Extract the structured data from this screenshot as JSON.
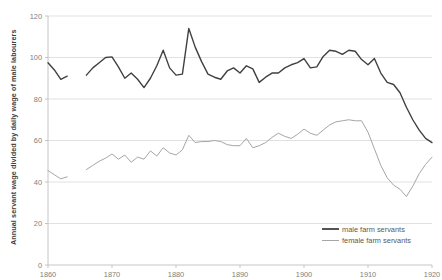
{
  "chart_data": {
    "type": "line",
    "title": "",
    "xlabel": "",
    "ylabel": "Annual servant wage divided by daily wage of male labourers",
    "xlim": [
      1860,
      1920
    ],
    "ylim": [
      0,
      120
    ],
    "xticks": [
      1860,
      1870,
      1880,
      1890,
      1900,
      1910,
      1920
    ],
    "yticks": [
      0,
      20,
      40,
      60,
      80,
      100,
      120
    ],
    "grid": true,
    "legend_position": "bottom-right",
    "series": [
      {
        "name": "male farm servants",
        "color": "#404040",
        "width": 1.4,
        "segments": [
          {
            "x": [
              1860,
              1861,
              1862,
              1863
            ],
            "y": [
              97.5,
              94.0,
              89.5,
              91.0
            ]
          },
          {
            "x": [
              1866,
              1867,
              1868,
              1869,
              1870,
              1871,
              1872,
              1873,
              1874,
              1875,
              1876,
              1877,
              1878,
              1879,
              1880,
              1881,
              1882,
              1883,
              1884,
              1885,
              1886,
              1887,
              1888,
              1889,
              1890,
              1891,
              1892,
              1893,
              1894,
              1895,
              1896,
              1897,
              1898,
              1899,
              1900,
              1901,
              1902,
              1903,
              1904,
              1905,
              1906,
              1907,
              1908,
              1909,
              1910,
              1911,
              1912,
              1913,
              1914,
              1915,
              1916,
              1917,
              1918,
              1919,
              1920
            ],
            "y": [
              91.5,
              95.0,
              97.5,
              100.0,
              100.3,
              95.5,
              90.0,
              92.5,
              89.5,
              85.5,
              90.0,
              96.0,
              103.5,
              95.0,
              91.5,
              92.0,
              114.0,
              105.0,
              98.0,
              92.0,
              90.5,
              89.5,
              93.5,
              95.0,
              92.5,
              96.0,
              94.5,
              88.0,
              90.5,
              92.5,
              92.5,
              95.0,
              96.5,
              97.5,
              99.5,
              95.0,
              95.5,
              100.5,
              103.5,
              103.0,
              101.5,
              103.5,
              103.0,
              99.0,
              96.5,
              99.5,
              92.5,
              88.0,
              87.0,
              83.0,
              76.0,
              70.0,
              65.0,
              61.0,
              59.0
            ]
          }
        ]
      },
      {
        "name": "female farm servants",
        "color": "#A6A6A6",
        "width": 1.0,
        "segments": [
          {
            "x": [
              1860,
              1861,
              1862,
              1863
            ],
            "y": [
              45.5,
              43.5,
              41.5,
              42.5
            ]
          },
          {
            "x": [
              1866,
              1867,
              1868,
              1869,
              1870,
              1871,
              1872,
              1873,
              1874,
              1875,
              1876,
              1877,
              1878,
              1879,
              1880,
              1881,
              1882,
              1883,
              1884,
              1885,
              1886,
              1887,
              1888,
              1889,
              1890,
              1891,
              1892,
              1893,
              1894,
              1895,
              1896,
              1897,
              1898,
              1899,
              1900,
              1901,
              1902,
              1903,
              1904,
              1905,
              1906,
              1907,
              1908,
              1909,
              1910,
              1911,
              1912,
              1913,
              1914,
              1915,
              1916,
              1917,
              1918,
              1919,
              1920
            ],
            "y": [
              46.0,
              48.0,
              50.0,
              51.5,
              53.5,
              51.0,
              53.0,
              49.5,
              52.0,
              51.0,
              55.0,
              52.5,
              56.5,
              54.0,
              53.0,
              55.5,
              62.5,
              59.0,
              59.5,
              59.5,
              60.0,
              59.5,
              58.0,
              57.5,
              57.5,
              61.0,
              56.5,
              57.5,
              59.0,
              61.5,
              63.5,
              62.0,
              61.0,
              63.0,
              65.5,
              63.5,
              62.5,
              65.0,
              67.5,
              69.0,
              69.5,
              70.0,
              69.5,
              69.5,
              64.0,
              56.0,
              48.0,
              42.0,
              38.5,
              36.5,
              33.0,
              38.0,
              44.0,
              48.5,
              52.0
            ]
          }
        ]
      }
    ]
  },
  "legend": {
    "items": [
      {
        "label": "male farm servants",
        "color": "#404040"
      },
      {
        "label": "female farm servants",
        "color": "#A6A6A6"
      }
    ]
  }
}
